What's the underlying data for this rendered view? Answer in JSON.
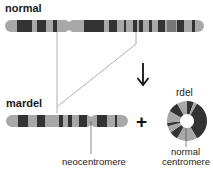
{
  "labels": {
    "normal_title": "normal",
    "mardel_title": "mardel",
    "rdel_title": "rdel",
    "neocentromere": "neocentromere",
    "normal_centromere_line1": "normal",
    "normal_centromere_line2": "centromere",
    "plus_symbol": "+"
  },
  "colors": {
    "light_band": "#a8a8a8",
    "dark_band": "#333333",
    "medium_band": "#777777",
    "line": "#9a9a9a",
    "arrow": "#111111"
  },
  "normal_chromosome": {
    "x_start": 5,
    "x_end": 204,
    "y": 20,
    "height": 12,
    "centromere_x": 69,
    "dark_bands": [
      [
        17,
        32
      ],
      [
        37,
        46
      ],
      [
        53,
        57
      ],
      [
        84,
        104
      ],
      [
        109,
        117
      ],
      [
        124,
        126
      ],
      [
        133,
        137
      ],
      [
        139,
        143
      ],
      [
        149,
        152
      ],
      [
        158,
        165
      ],
      [
        177,
        184
      ],
      [
        192,
        195
      ]
    ],
    "medium_bands": [
      [
        167,
        176
      ]
    ]
  },
  "mardel_chromosome": {
    "x_start": 6,
    "x_end": 128,
    "y": 115,
    "height": 12,
    "neocentromere_x": 91,
    "dark_bands": [
      [
        18,
        28
      ],
      [
        37,
        45
      ],
      [
        59,
        63
      ],
      [
        68,
        72
      ],
      [
        79,
        87
      ],
      [
        97,
        107
      ],
      [
        115,
        117
      ]
    ]
  },
  "rdel_ring": {
    "cx": 187,
    "cy": 121,
    "outer_r": 20,
    "inner_r": 7,
    "segments": [
      {
        "from": -30,
        "to": 0,
        "tone": "light"
      },
      {
        "from": 0,
        "to": 20,
        "tone": "dark"
      },
      {
        "from": 20,
        "to": 30,
        "tone": "light"
      },
      {
        "from": 30,
        "to": 150,
        "tone": "dark"
      },
      {
        "from": 150,
        "to": 210,
        "tone": "light"
      },
      {
        "from": 210,
        "to": 235,
        "tone": "dark"
      },
      {
        "from": 235,
        "to": 255,
        "tone": "light"
      },
      {
        "from": 255,
        "to": 265,
        "tone": "dark"
      },
      {
        "from": 265,
        "to": 300,
        "tone": "light"
      },
      {
        "from": 300,
        "to": 330,
        "tone": "dark"
      }
    ]
  }
}
